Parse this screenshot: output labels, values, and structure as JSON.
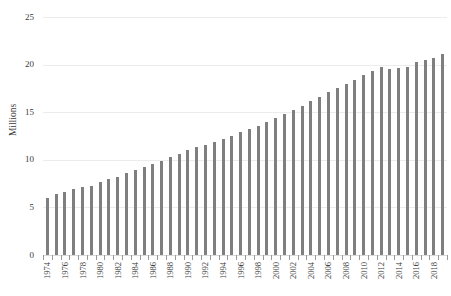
{
  "chart_data": {
    "type": "bar",
    "title": "",
    "subtitle": "",
    "xlabel": "",
    "ylabel": "Millions",
    "ylim": [
      0,
      25
    ],
    "yticks": [
      0,
      5,
      10,
      15,
      20,
      25
    ],
    "ytick_labels": [
      "0",
      "5",
      "10",
      "15",
      "20",
      "25"
    ],
    "grid": true,
    "legend": false,
    "legend_position": "none",
    "bar_color": "#7f7f7f",
    "gridline_color": "#ececed",
    "axis_color": "#d9d9d9",
    "text_color": "#3b3b3b",
    "categories": [
      "1974",
      "1975",
      "1976",
      "1977",
      "1978",
      "1979",
      "1980",
      "1981",
      "1982",
      "1983",
      "1984",
      "1985",
      "1986",
      "1987",
      "1988",
      "1989",
      "1990",
      "1991",
      "1992",
      "1993",
      "1994",
      "1995",
      "1996",
      "1997",
      "1998",
      "1999",
      "2000",
      "2001",
      "2002",
      "2003",
      "2004",
      "2005",
      "2006",
      "2007",
      "2008",
      "2009",
      "2010",
      "2011",
      "2012",
      "2013",
      "2014",
      "2015",
      "2016",
      "2017",
      "2018",
      "2019"
    ],
    "xtick_labels_shown": [
      "1974",
      "1976",
      "1978",
      "1980",
      "1982",
      "1984",
      "1986",
      "1988",
      "1990",
      "1992",
      "1994",
      "1996",
      "1998",
      "2000",
      "2002",
      "2004",
      "2006",
      "2008",
      "2010",
      "2012",
      "2014",
      "2016",
      "2018"
    ],
    "values": [
      6.0,
      6.4,
      6.6,
      6.9,
      7.1,
      7.3,
      7.7,
      8.0,
      8.2,
      8.6,
      8.9,
      9.2,
      9.6,
      9.9,
      10.3,
      10.6,
      11.0,
      11.3,
      11.6,
      11.9,
      12.2,
      12.5,
      12.9,
      13.2,
      13.6,
      14.0,
      14.4,
      14.8,
      15.2,
      15.7,
      16.2,
      16.6,
      17.1,
      17.5,
      18.0,
      18.4,
      18.9,
      19.3,
      19.7,
      19.5,
      19.6,
      19.8,
      20.3,
      20.5,
      20.7,
      21.1
    ]
  }
}
